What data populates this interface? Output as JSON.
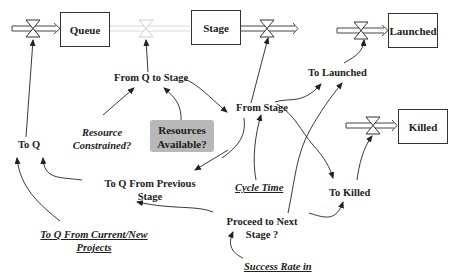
{
  "stocks": {
    "queue": "Queue",
    "stage": "Stage",
    "launched": "Launched",
    "killed": "Killed"
  },
  "flows": {
    "to_q": "To Q",
    "from_q_to_stage": "From Q to Stage",
    "from_stage": "From Stage",
    "to_launched": "To Launched",
    "to_killed": "To Killed"
  },
  "auxiliaries": {
    "resource_constrained_1": "Resource",
    "resource_constrained_2": "Constrained?",
    "resources_available_1": "Resources",
    "resources_available_2": "Available?",
    "to_q_from_previous_1": "To Q From Previous",
    "to_q_from_previous_2": "Stage",
    "cycle_time": "Cycle Time",
    "proceed_1": "Proceed to Next",
    "proceed_2": "Stage ?",
    "to_q_from_current_1": "To Q From Current/New",
    "to_q_from_current_2": "Projects",
    "success_rate": "Success Rate in"
  },
  "colors": {
    "line": "#222222",
    "faded_flow": "#cfcfcf",
    "resources_box": "#b8b8b8"
  }
}
